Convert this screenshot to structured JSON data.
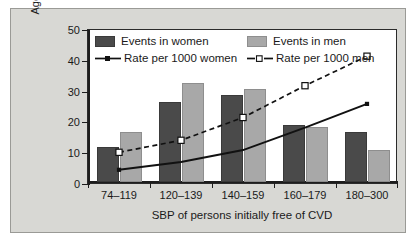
{
  "chart_data": {
    "type": "bar",
    "title": "",
    "xlabel": "SBP of persons initially free of CVD",
    "ylabel_line1": "Age-adjusted annual rate,",
    "ylabel_line2": "% of events",
    "categories": [
      "74–119",
      "120–139",
      "140–159",
      "160–179",
      "180–300"
    ],
    "ylim": [
      0,
      50
    ],
    "yticks": [
      0,
      10,
      20,
      30,
      40,
      50
    ],
    "ytick_labels": [
      "0",
      "10",
      "20",
      "30",
      "40",
      "50"
    ],
    "grid": false,
    "legend_position": "inside-top-left",
    "series": [
      {
        "name": "Events in women",
        "kind": "bar",
        "color": "#4a4a4a",
        "values": [
          11.5,
          26.1,
          28.4,
          18.6,
          16.2
        ]
      },
      {
        "name": "Events in men",
        "kind": "bar",
        "color": "#a8a8a8",
        "values": [
          16.3,
          32.1,
          30.2,
          17.7,
          10.5
        ]
      },
      {
        "name": "Rate per 1000 women",
        "kind": "line-solid",
        "color": "#111111",
        "marker": "filled-square",
        "values": [
          4.6,
          7.1,
          11.0,
          18.3,
          26.0
        ]
      },
      {
        "name": "Rate per 1000 men",
        "kind": "line-dashed",
        "color": "#111111",
        "marker": "open-square",
        "values": [
          10.3,
          14.2,
          21.6,
          31.9,
          41.5
        ]
      }
    ]
  },
  "legend": {
    "row1": [
      {
        "label": "Events in women",
        "swatch": "dark-gray-square"
      },
      {
        "label": "Events in men",
        "swatch": "light-gray-square"
      }
    ],
    "row2": [
      {
        "label": "Rate per 1000 women",
        "key": "solid-line-filled-marker"
      },
      {
        "label": "Rate per 1000 men",
        "key": "dashed-line-open-square-marker"
      }
    ]
  },
  "colors": {
    "card_background": "#d8d8d4",
    "plot_background": "#ffffff",
    "axis": "#1d1d1d",
    "women_bar": "#4a4a4a",
    "men_bar": "#a8a8a8",
    "line": "#111111"
  }
}
